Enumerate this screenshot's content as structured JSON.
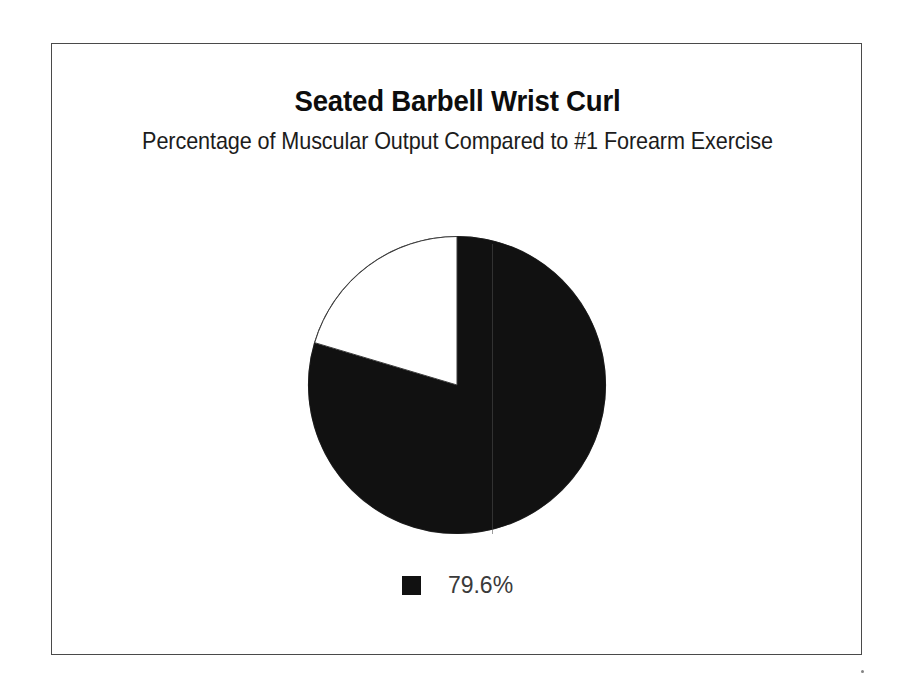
{
  "chart_data": {
    "type": "pie",
    "title": "Seated Barbell Wrist Curl",
    "subtitle": "Percentage of Muscular Output Compared to #1 Forearm Exercise",
    "xlabel": "",
    "ylabel": "",
    "grid": false,
    "legend_position": "bottom",
    "start_angle_deg": 0,
    "direction": "clockwise",
    "categories": [
      "79.6%",
      ""
    ],
    "values": [
      79.6,
      20.4
    ],
    "slices": [
      {
        "label": "79.6%",
        "value": 79.6,
        "color": "#111111",
        "in_legend": true
      },
      {
        "label": "",
        "value": 20.4,
        "color": "#ffffff",
        "in_legend": false
      }
    ],
    "legend": [
      {
        "label": "79.6%",
        "color": "#111111"
      }
    ]
  },
  "figure": {
    "title": "Seated Barbell Wrist Curl",
    "subtitle": "Percentage of Muscular Output Compared to #1 Forearm Exercise",
    "border_color": "#4a4a4a",
    "background_color": "#ffffff"
  },
  "pie": {
    "filled_slice_label": "79.6%",
    "filled_slice_color": "#111111",
    "empty_slice_color": "#ffffff",
    "outline_color": "#3c3c3c"
  },
  "legend": {
    "swatch_color": "#111111",
    "label": "79.6%"
  }
}
